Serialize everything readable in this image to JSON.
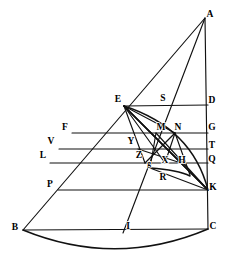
{
  "figure": {
    "stroke_color": "#111111",
    "background_color": "#ffffff",
    "label_color": "#000000",
    "width": 229,
    "height": 273
  },
  "points": [
    {
      "id": "A",
      "label": "A",
      "x": 205,
      "y": 18,
      "lx": 210,
      "ly": 15,
      "size": "normal"
    },
    {
      "id": "E",
      "label": "E",
      "x": 124,
      "y": 106,
      "lx": 118,
      "ly": 100,
      "size": "normal"
    },
    {
      "id": "S",
      "label": "S",
      "x": 163,
      "y": 105,
      "lx": 163,
      "ly": 99,
      "size": "normal"
    },
    {
      "id": "D",
      "label": "D",
      "x": 208,
      "y": 105,
      "lx": 212,
      "ly": 101,
      "size": "normal"
    },
    {
      "id": "F",
      "label": "F",
      "x": 72,
      "y": 133,
      "lx": 65,
      "ly": 128,
      "size": "normal"
    },
    {
      "id": "M",
      "label": "M",
      "x": 156,
      "y": 133,
      "lx": 161,
      "ly": 128,
      "size": "normal"
    },
    {
      "id": "N",
      "label": "N",
      "x": 175,
      "y": 133,
      "lx": 178,
      "ly": 128,
      "size": "normal"
    },
    {
      "id": "G",
      "label": "G",
      "x": 208,
      "y": 133,
      "lx": 212,
      "ly": 128,
      "size": "normal"
    },
    {
      "id": "V",
      "label": "V",
      "x": 59,
      "y": 149,
      "lx": 51,
      "ly": 142,
      "size": "normal"
    },
    {
      "id": "Y",
      "label": "Y",
      "x": 138,
      "y": 149,
      "lx": 131,
      "ly": 142,
      "size": "normal"
    },
    {
      "id": "T",
      "label": "T",
      "x": 208,
      "y": 149,
      "lx": 212,
      "ly": 146,
      "size": "normal"
    },
    {
      "id": "L",
      "label": "L",
      "x": 50,
      "y": 163,
      "lx": 43,
      "ly": 156,
      "size": "normal"
    },
    {
      "id": "Z",
      "label": "Z",
      "x": 145,
      "y": 163,
      "lx": 139,
      "ly": 156,
      "size": "normal"
    },
    {
      "id": "X",
      "label": "X",
      "x": 165,
      "y": 163,
      "lx": 165,
      "ly": 161,
      "size": "normal"
    },
    {
      "id": "H",
      "label": "H",
      "x": 181,
      "y": 163,
      "lx": 182,
      "ly": 161,
      "size": "normal"
    },
    {
      "id": "Q",
      "label": "Q",
      "x": 208,
      "y": 163,
      "lx": 212,
      "ly": 160,
      "size": "normal"
    },
    {
      "id": "g",
      "label": "g",
      "x": 150,
      "y": 168,
      "lx": 149,
      "ly": 164,
      "size": "small"
    },
    {
      "id": "P",
      "label": "P",
      "x": 58,
      "y": 190,
      "lx": 50,
      "ly": 185,
      "size": "normal"
    },
    {
      "id": "R",
      "label": "R",
      "x": 163,
      "y": 182,
      "lx": 163,
      "ly": 178,
      "size": "normal"
    },
    {
      "id": "K",
      "label": "K",
      "x": 208,
      "y": 190,
      "lx": 213,
      "ly": 188,
      "size": "normal"
    },
    {
      "id": "B",
      "label": "B",
      "x": 23,
      "y": 230,
      "lx": 15,
      "ly": 228,
      "size": "normal"
    },
    {
      "id": "I",
      "label": "I",
      "x": 123,
      "y": 230,
      "lx": 128,
      "ly": 227,
      "size": "normal"
    },
    {
      "id": "C",
      "label": "C",
      "x": 208,
      "y": 229,
      "lx": 213,
      "ly": 227,
      "size": "normal"
    }
  ],
  "segments": [
    {
      "name": "side-AB",
      "d": "M 205 18 L 23 230"
    },
    {
      "name": "side-AC",
      "d": "M 205 18 L 208 229"
    },
    {
      "name": "line-AI",
      "d": "M 205 18 L 123 233"
    },
    {
      "name": "base-BC",
      "d": "M 23 230 L 208 229"
    },
    {
      "name": "line-ED",
      "d": "M 124 106 L 208 105"
    },
    {
      "name": "line-FG",
      "d": "M 72 133 L 208 133"
    },
    {
      "name": "line-VT",
      "d": "M 59 149 L 208 149"
    },
    {
      "name": "line-LQ",
      "d": "M 50 163 L 208 163"
    },
    {
      "name": "line-PK",
      "d": "M 58 190 L 208 190"
    },
    {
      "name": "line-E-to-K",
      "d": "M 124 106 L 208 190"
    },
    {
      "name": "line-E-to-X",
      "d": "M 124 106 L 165 163"
    },
    {
      "name": "line-E-to-Z",
      "d": "M 124 106 L 145 163"
    },
    {
      "name": "line-E-to-N",
      "d": "M 124 106 L 175 133"
    },
    {
      "name": "line-E-to-H",
      "d": "M 124 106 L 181 163"
    },
    {
      "name": "line-M-to-K",
      "d": "M 156 133 L 208 190"
    },
    {
      "name": "line-N-to-Hk",
      "d": "M 175 133 L 190 175"
    },
    {
      "name": "line-Y-to-H",
      "d": "M 138 149 L 181 163"
    },
    {
      "name": "line-Z-to-N",
      "d": "M 145 163 L 175 133"
    },
    {
      "name": "line-g-to-M",
      "d": "M 150 168 L 156 133"
    },
    {
      "name": "line-X-to-M",
      "d": "M 165 163 L 175 133"
    },
    {
      "name": "line-g-to-K",
      "d": "M 150 168 L 208 190"
    },
    {
      "name": "line-H-to-K",
      "d": "M 181 163 L 208 190"
    }
  ],
  "arcs": [
    {
      "name": "arc-E-to-K",
      "d": "M 124 106 Q 192 128 208 190"
    },
    {
      "name": "arc-E-to-K-inner",
      "d": "M 124 106 Q 166 148 208 190"
    },
    {
      "name": "arc-small-g",
      "d": "M 150 168 Q 178 170 190 176"
    },
    {
      "name": "arc-bottom-BC",
      "d": "M 23 230 Q 116 268 208 229"
    }
  ]
}
